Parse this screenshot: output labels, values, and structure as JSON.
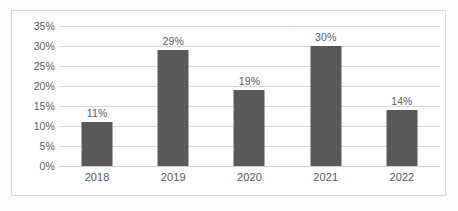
{
  "chart_data": {
    "type": "bar",
    "title": "",
    "subtitle": "",
    "xlabel": "",
    "ylabel": "",
    "categories": [
      "2018",
      "2019",
      "2020",
      "2021",
      "2022"
    ],
    "values": [
      11,
      29,
      19,
      30,
      14
    ],
    "value_labels": [
      "11%",
      "29%",
      "19%",
      "30%",
      "14%"
    ],
    "ylim": [
      0,
      35
    ],
    "ytick_values": [
      35,
      30,
      25,
      20,
      15,
      10,
      5,
      0
    ],
    "ytick_labels": [
      "35%",
      "30%",
      "25%",
      "20%",
      "15%",
      "10%",
      "5%",
      "0%"
    ],
    "grid": true,
    "legend": false,
    "legend_position": "none",
    "series": [
      {
        "name": "",
        "values": [
          11,
          29,
          19,
          30,
          14
        ],
        "color": "#595959"
      }
    ],
    "colors": {
      "bar": "#595959",
      "gridline": "#d9d9d9",
      "text": "#5a5a5a",
      "border": "#d9d9d9",
      "background": "#ffffff"
    }
  }
}
